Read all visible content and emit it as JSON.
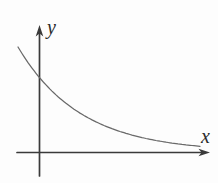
{
  "figure": {
    "kind": "function-graph"
  },
  "colors": {
    "background": "#fdfdfd",
    "axis": "#3a3a3a",
    "curve": "#696969",
    "label": "#2b2b2b"
  },
  "chart_data": {
    "type": "line",
    "title": "",
    "xlabel": "x",
    "ylabel": "y",
    "grid": false,
    "legend": null,
    "x_ticks": [],
    "y_ticks": [],
    "axes_px": {
      "origin": [
        39.5,
        152.5
      ],
      "y_axis": {
        "x": 39.5,
        "arrow_tip_y": 25,
        "bottom_y": 176
      },
      "x_axis": {
        "y": 152.5,
        "left_x": 17,
        "arrow_tip_x": 210
      }
    },
    "series": [
      {
        "name": "decreasing-exponential-curve",
        "model_px": "y = asymptote - amplitude * exp(-decay * x) in screen pixel coordinates",
        "params": {
          "asymptote": 152,
          "amplitude": 140,
          "decay": 0.016
        },
        "x_px_range": [
          18,
          200
        ],
        "sample_points_px": [
          [
            18,
            47
          ],
          [
            30,
            65
          ],
          [
            40,
            78
          ],
          [
            60,
            98
          ],
          [
            80,
            114
          ],
          [
            100,
            124
          ],
          [
            120,
            131
          ],
          [
            140,
            137
          ],
          [
            160,
            141
          ],
          [
            180,
            144
          ],
          [
            200,
            146
          ]
        ]
      }
    ]
  }
}
